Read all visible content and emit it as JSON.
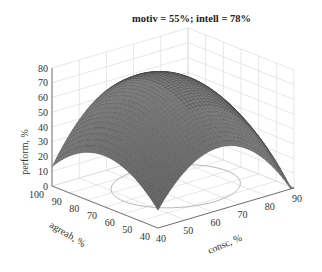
{
  "title": "motiv = 55%; intell = 78%",
  "chart_data": {
    "type": "surface3d",
    "title": "motiv = 55%; intell = 78%",
    "xlabel": "consc, %",
    "ylabel": "agreab, %",
    "zlabel": "perform, %",
    "x_ticks": [
      "40",
      "50",
      "60",
      "70",
      "80",
      "90"
    ],
    "y_ticks": [
      "40",
      "50",
      "60",
      "70",
      "80",
      "90",
      "100"
    ],
    "z_ticks": [
      "0",
      "10",
      "20",
      "30",
      "40",
      "50",
      "60",
      "70",
      "80"
    ],
    "xlim": [
      40,
      90
    ],
    "ylim": [
      40,
      100
    ],
    "zlim": [
      0,
      80
    ],
    "grid": true,
    "colormap": "grayscale",
    "contour_on_floor": "ellipse",
    "surface_corners": [
      {
        "consc": 40,
        "agreab": 100,
        "perform": 30
      },
      {
        "consc": 40,
        "agreab": 40,
        "perform": 0
      },
      {
        "consc": 90,
        "agreab": 40,
        "perform": 18
      },
      {
        "consc": 90,
        "agreab": 100,
        "perform": 48
      }
    ],
    "peak": {
      "consc": 65,
      "agreab": 75,
      "perform": 72
    }
  },
  "axes": {
    "zlabel": "perform, %",
    "ylabel": "agreab, %",
    "xlabel": "consc, %"
  }
}
